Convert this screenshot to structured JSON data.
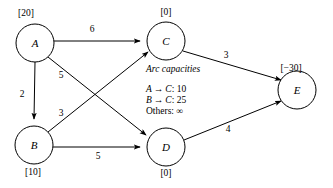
{
  "diagram": {
    "nodes": [
      {
        "id": "A",
        "label": "A",
        "supply": "[20]",
        "cx": 35,
        "cy": 43,
        "r": 19,
        "supply_x": 26,
        "supply_y": 14
      },
      {
        "id": "C",
        "label": "C",
        "supply": "[0]",
        "cx": 166,
        "cy": 41,
        "r": 19,
        "supply_x": 166,
        "supply_y": 13
      },
      {
        "id": "E",
        "label": "E",
        "supply": "[-30]",
        "supply_display": "[−30]",
        "cx": 297,
        "cy": 90,
        "r": 19,
        "supply_x": 291,
        "supply_y": 69
      },
      {
        "id": "B",
        "label": "B",
        "supply": "[10]",
        "cx": 34,
        "cy": 145,
        "r": 19,
        "supply_x": 33,
        "supply_y": 173
      },
      {
        "id": "D",
        "label": "D",
        "supply": "[0]",
        "cx": 166,
        "cy": 147,
        "r": 19,
        "supply_x": 166,
        "supply_y": 174
      }
    ],
    "edges": [
      {
        "id": "A-C",
        "from": "A",
        "to": "C",
        "cost": "6",
        "label_x": 92,
        "label_y": 30
      },
      {
        "id": "A-B",
        "from": "A",
        "to": "B",
        "cost": "2",
        "label_x": 22,
        "label_y": 95
      },
      {
        "id": "A-D",
        "from": "A",
        "to": "D",
        "cost": "5",
        "label_x": 61,
        "label_y": 76
      },
      {
        "id": "B-C",
        "from": "B",
        "to": "C",
        "cost": "3",
        "label_x": 61,
        "label_y": 114
      },
      {
        "id": "B-D",
        "from": "B",
        "to": "D",
        "cost": "5",
        "label_x": 98,
        "label_y": 157
      },
      {
        "id": "C-E",
        "from": "C",
        "to": "E",
        "cost": "3",
        "label_x": 226,
        "label_y": 56
      },
      {
        "id": "D-E",
        "from": "D",
        "to": "E",
        "cost": "4",
        "label_x": 228,
        "label_y": 130
      }
    ],
    "capacities": {
      "title": "Arc capacities",
      "title_x": 146,
      "title_y": 65,
      "list_x": 146,
      "list_y": 84,
      "rows": [
        {
          "from": "A",
          "arrow": "→",
          "to": "C",
          "value": ": 10"
        },
        {
          "from": "B",
          "arrow": "→",
          "to": "C",
          "value": ": 25"
        }
      ],
      "others": "Others: ∞"
    },
    "colors": {
      "stroke": "#000000",
      "fill": "#ffffff",
      "background": "#ffffff"
    }
  }
}
